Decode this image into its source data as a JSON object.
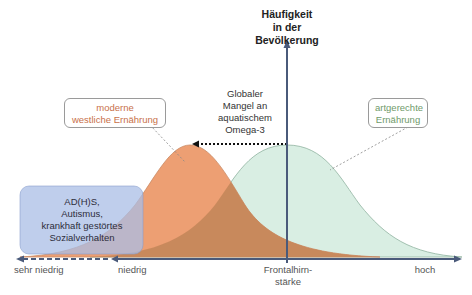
{
  "diagram": {
    "y_axis_label": [
      "Häufigkeit",
      "in der",
      "Bevölkerung"
    ],
    "annotation_center": [
      "Globaler",
      "Mangel an",
      "aquatischem",
      "Omega-3"
    ],
    "box_western": [
      "moderne",
      "westliche Ernährung"
    ],
    "box_species": [
      "artgerechte",
      "Ernährung"
    ],
    "box_conditions": [
      "AD(H)S,",
      "Autismus,",
      "krankhaft gestörtes",
      "Sozialverhalten"
    ],
    "x_labels": {
      "very_low": "sehr niedrig",
      "low": "niedrig",
      "middle": [
        "Frontalhirn-",
        "stärke"
      ],
      "high": "hoch"
    },
    "colors": {
      "western_curve": "#ec9a6c",
      "species_curve": "#d9eee3",
      "overlap": "#c9895c",
      "conditions_box": "#a9bde6",
      "axis": "#4a5a7a"
    }
  }
}
